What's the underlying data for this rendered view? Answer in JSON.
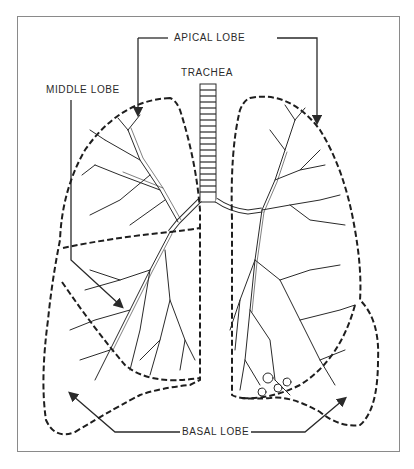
{
  "diagram": {
    "labels": {
      "apical": "APICAL LOBE",
      "middle": "MIDDLE LOBE",
      "trachea": "TRACHEA",
      "basal": "BASAL LOBE"
    },
    "colors": {
      "ink": "#2a2a2a",
      "frame": "#8a8a8a",
      "background": "#ffffff"
    }
  }
}
